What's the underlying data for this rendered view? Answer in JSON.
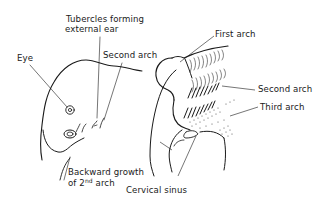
{
  "diagram": {
    "colors": {
      "ink": "#1a1a1a",
      "background": "#ffffff",
      "stipple": "#333333"
    },
    "left_figure": {
      "labels": {
        "tubercles_line1": "Tubercles forming",
        "tubercles_line2": "external ear",
        "eye": "Eye",
        "second_arch": "Second arch",
        "backward_growth_line1": "Backward growth",
        "backward_growth_line2_prefix": "of 2",
        "backward_growth_sup": "nd",
        "backward_growth_line2_suffix": " arch"
      }
    },
    "right_figure": {
      "labels": {
        "first_arch": "First arch",
        "second_arch": "Second arch",
        "third_arch": "Third arch",
        "cervical_sinus": "Cervical sinus"
      }
    }
  }
}
